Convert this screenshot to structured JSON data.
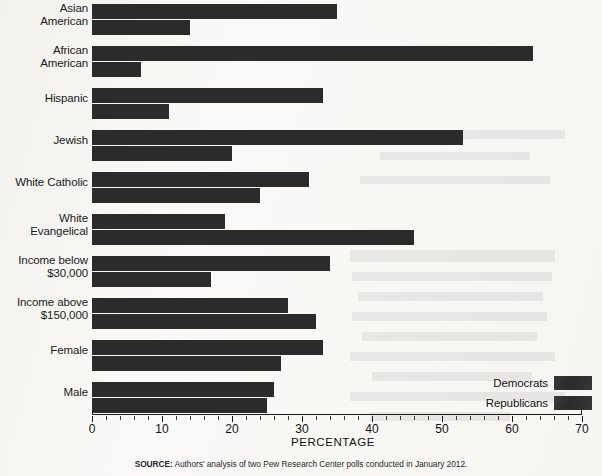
{
  "chart_data": {
    "type": "bar",
    "orientation": "horizontal",
    "title": "",
    "xlabel": "PERCENTAGE",
    "ylabel": "",
    "xlim": [
      0,
      70
    ],
    "xticks": [
      0,
      10,
      20,
      30,
      40,
      50,
      60,
      70
    ],
    "xtick_labels": [
      "0",
      "10",
      "20",
      "30",
      "40",
      "50",
      "60",
      "70"
    ],
    "minor_tick_step": 2,
    "grid": false,
    "legend_position": "bottom-right",
    "categories": [
      "Asian\nAmerican",
      "African\nAmerican",
      "Hispanic",
      "Jewish",
      "White Catholic",
      "White\nEvangelical",
      "Income below\n$30,000",
      "Income above\n$150,000",
      "Female",
      "Male"
    ],
    "series": [
      {
        "name": "Democrats",
        "color": "#2b2b2b",
        "values": [
          35,
          63,
          33,
          53,
          31,
          19,
          34,
          28,
          33,
          26
        ]
      },
      {
        "name": "Republicans",
        "color": "#2b2b2b",
        "values": [
          14,
          7,
          11,
          20,
          24,
          46,
          17,
          32,
          27,
          25
        ]
      }
    ]
  },
  "legend": {
    "items": [
      {
        "label": "Democrats",
        "color": "#2b2b2b"
      },
      {
        "label": "Republicans",
        "color": "#2b2b2b"
      }
    ]
  },
  "source": {
    "label": "SOURCE:",
    "text": " Authors' analysis of two Pew Research Center polls conducted in January 2012."
  }
}
